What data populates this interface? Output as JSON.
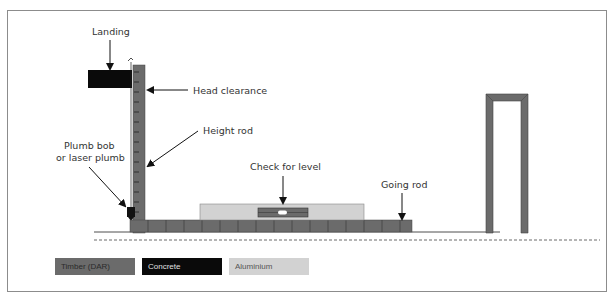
{
  "labels": {
    "landing": "Landing",
    "head_clearance": "Head clearance",
    "height_rod": "Height rod",
    "plumb_line1": "Plumb bob",
    "plumb_line2": "or laser plumb",
    "check_level": "Check for level",
    "going_rod": "Going rod"
  },
  "legend": [
    {
      "label": "Timber (DAR)",
      "color": "#6b6b6b",
      "text_color": "#2a2a2a"
    },
    {
      "label": "Concrete",
      "color": "#0a0a0a",
      "text_color": "#e0e0e0"
    },
    {
      "label": "Aluminium",
      "color": "#d2d2d2",
      "text_color": "#555555"
    }
  ],
  "colors": {
    "timber": "#6b6b6b",
    "concrete": "#0a0a0a",
    "aluminium": "#d2d2d2",
    "line": "#1a1a1a"
  }
}
